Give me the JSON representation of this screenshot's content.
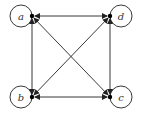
{
  "diagram": {
    "type": "directed-graph",
    "nodes": [
      {
        "id": "a",
        "label": "a",
        "x": 32,
        "y": 16,
        "loop": "left"
      },
      {
        "id": "d",
        "label": "d",
        "x": 110,
        "y": 16,
        "loop": "right"
      },
      {
        "id": "b",
        "label": "b",
        "x": 32,
        "y": 97,
        "loop": "left"
      },
      {
        "id": "c",
        "label": "c",
        "x": 110,
        "y": 97,
        "loop": "right"
      }
    ],
    "edges": [
      {
        "from": "a",
        "to": "d",
        "bidirectional": true
      },
      {
        "from": "a",
        "to": "b",
        "bidirectional": true
      },
      {
        "from": "b",
        "to": "c",
        "bidirectional": true
      },
      {
        "from": "d",
        "to": "c",
        "bidirectional": true
      },
      {
        "from": "a",
        "to": "c",
        "bidirectional": true
      },
      {
        "from": "d",
        "to": "b",
        "bidirectional": true
      },
      {
        "from": "a",
        "to": "a",
        "self_loop": true
      },
      {
        "from": "b",
        "to": "b",
        "self_loop": true
      },
      {
        "from": "c",
        "to": "c",
        "self_loop": true
      },
      {
        "from": "d",
        "to": "d",
        "self_loop": true
      }
    ],
    "colors": {
      "stroke": "#222222",
      "node": "#000000",
      "background": "#ffffff"
    }
  }
}
